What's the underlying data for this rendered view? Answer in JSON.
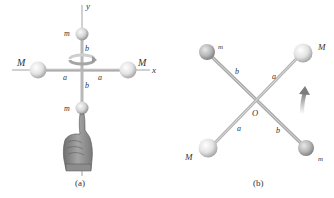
{
  "figure": {
    "panel_a": {
      "caption": "(a)",
      "axis_y_label": "y",
      "axis_x_label": "x",
      "mass_left_label": "M",
      "mass_right_label": "M",
      "mass_top_label": "m",
      "mass_bottom_label": "m",
      "rod_left_label": "a",
      "rod_right_label": "a",
      "rod_top_label": "b",
      "rod_bottom_label": "b"
    },
    "panel_b": {
      "caption": "(b)",
      "origin_label": "O",
      "mass_top_left_label": "m",
      "mass_top_right_label": "M",
      "mass_bottom_left_label": "M",
      "mass_bottom_right_label": "m",
      "rod_upper_left_label": "b",
      "rod_upper_right_label": "a",
      "rod_lower_left_label": "a",
      "rod_lower_right_label": "b"
    },
    "colors": {
      "rod": "#b9b9b9",
      "sphere_light": "#f4f4f4",
      "sphere_dark": "#9a9a9a",
      "axis": "#777777",
      "arrow": "#8c8c8c",
      "text": "#333333"
    }
  }
}
